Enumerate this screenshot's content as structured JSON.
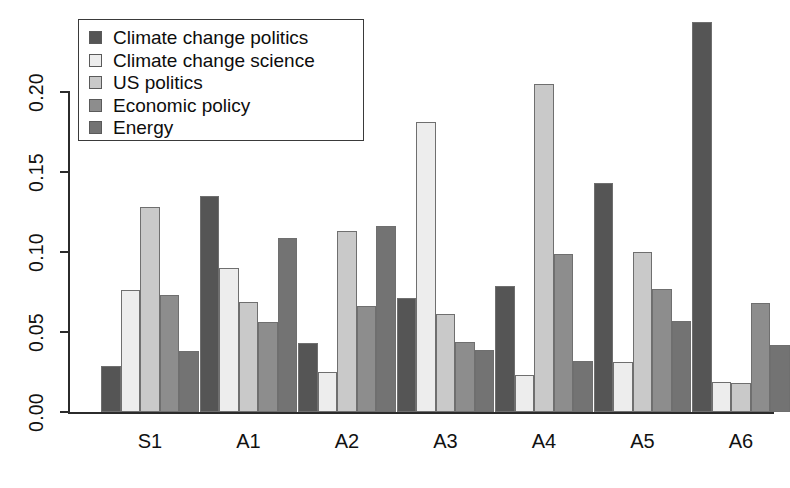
{
  "chart_data": {
    "type": "bar",
    "title": "",
    "xlabel": "",
    "ylabel": "",
    "ylim": [
      0.0,
      0.25
    ],
    "grid": false,
    "legend_position": "top-left",
    "categories": [
      "S1",
      "A1",
      "A2",
      "A3",
      "A4",
      "A5",
      "A6"
    ],
    "ytick_labels": [
      "0.00",
      "0.05",
      "0.10",
      "0.15",
      "0.20"
    ],
    "ytick_values": [
      0.0,
      0.05,
      0.1,
      0.15,
      0.2
    ],
    "series": [
      {
        "name": "Climate change politics",
        "color": "#555555",
        "values": [
          0.029,
          0.135,
          0.043,
          0.071,
          0.079,
          0.143,
          0.244
        ]
      },
      {
        "name": "Climate change science",
        "color": "#ededed",
        "values": [
          0.076,
          0.09,
          0.025,
          0.181,
          0.023,
          0.031,
          0.019
        ]
      },
      {
        "name": "US politics",
        "color": "#c9c9c9",
        "values": [
          0.128,
          0.069,
          0.113,
          0.061,
          0.205,
          0.1,
          0.018
        ]
      },
      {
        "name": "Economic policy",
        "color": "#8d8d8d",
        "values": [
          0.073,
          0.056,
          0.066,
          0.044,
          0.099,
          0.077,
          0.068
        ]
      },
      {
        "name": "Energy",
        "color": "#737373",
        "values": [
          0.038,
          0.109,
          0.116,
          0.039,
          0.032,
          0.057,
          0.042
        ]
      }
    ]
  },
  "legend": {
    "items": [
      {
        "label": "Climate change politics",
        "swatch": "#555555"
      },
      {
        "label": "Climate change science",
        "swatch": "#ededed"
      },
      {
        "label": "US politics",
        "swatch": "#c9c9c9"
      },
      {
        "label": "Economic policy",
        "swatch": "#8d8d8d"
      },
      {
        "label": "Energy",
        "swatch": "#737373"
      }
    ]
  },
  "caption": {
    "text": ""
  }
}
